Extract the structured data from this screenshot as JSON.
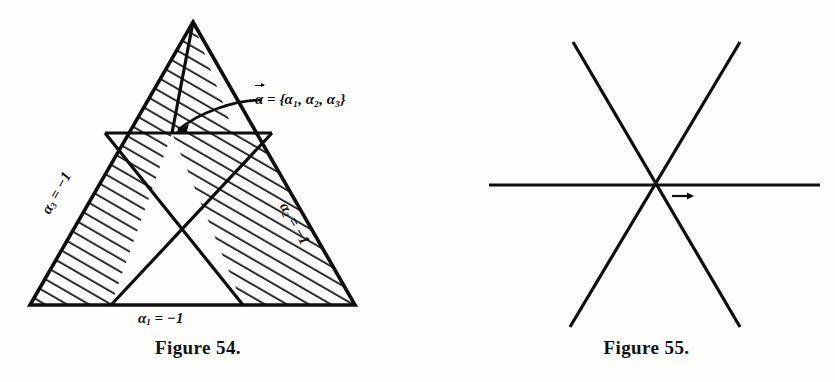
{
  "page": {
    "background_color": "#fdfdfb",
    "ink_color": "#0d0d0d"
  },
  "figure54": {
    "caption": "Figure 54.",
    "labels": {
      "vector_alpha": "α",
      "vector_equals": "=",
      "vector_components_open": "{",
      "vector_components": "α₁, α₂, α₃",
      "vector_components_close": "}",
      "vector_full_text": "α⃗ = {α₁, α₂, α₃}",
      "bottom_edge": "α₁ = −1",
      "bottom_edge_symbol": "α",
      "bottom_edge_sub": "1",
      "bottom_edge_value": "= −1",
      "right_edge_symbol": "α",
      "right_edge_sub": "2",
      "right_edge_value": "= −1",
      "right_edge": "α₂ = −1",
      "left_edge_symbol": "α",
      "left_edge_sub": "3",
      "left_edge_value": "= −1",
      "left_edge": "α₃ = −1"
    },
    "geometry": {
      "apex": [
        193,
        22
      ],
      "base_left": [
        30,
        305
      ],
      "base_right": [
        355,
        305
      ],
      "center_point": [
        172,
        133
      ],
      "midline_left": [
        105,
        133
      ],
      "midline_right": [
        272,
        133
      ],
      "hatch_angle_deg": 60,
      "shaded_regions": [
        "upper-left-band",
        "left-band",
        "right-band"
      ]
    }
  },
  "figure55": {
    "caption": "Figure 55.",
    "labels": {
      "vector_alpha": "α",
      "regions": [
        "A",
        "B",
        "C",
        "D",
        "E",
        "F"
      ]
    },
    "geometry": {
      "center": [
        655,
        185
      ],
      "horizontal_line": [
        [
          489,
          185
        ],
        [
          820,
          185
        ]
      ],
      "line_down_right": [
        [
          573,
          42
        ],
        [
          740,
          327
        ]
      ],
      "line_up_right": [
        [
          570,
          327
        ],
        [
          740,
          42
        ]
      ],
      "region_positions": {
        "A": [
          655,
          88
        ],
        "B": [
          742,
          140
        ],
        "C": [
          743,
          238
        ],
        "D": [
          655,
          290
        ],
        "E": [
          573,
          238
        ],
        "F": [
          571,
          140
        ]
      }
    }
  }
}
